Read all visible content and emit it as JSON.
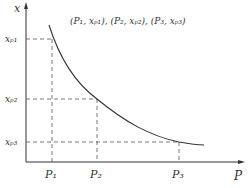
{
  "axes": {
    "y_label": "x",
    "x_label": "P"
  },
  "annotation": "(P₁, xₚ₁), (P₂, xₚ₂), (P₃, xₚ₃)",
  "points": [
    {
      "p_label": "P₁",
      "x_label": "xₚ₁"
    },
    {
      "p_label": "P₂",
      "x_label": "xₚ₂"
    },
    {
      "p_label": "P₃",
      "x_label": "xₚ₃"
    }
  ],
  "colors": {
    "line": "#333333",
    "dash": "#555555"
  }
}
